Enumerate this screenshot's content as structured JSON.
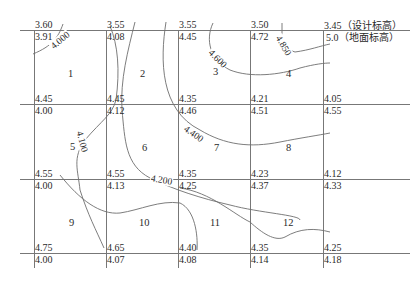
{
  "diagram": {
    "type": "grid-contour-map",
    "legend": {
      "design_elevation": "3.45（设计标高）",
      "ground_elevation": "5.0（地面标高）"
    },
    "grid_nodes": [
      {
        "row": 0,
        "col": 0,
        "design": "3.60",
        "ground": "3.91"
      },
      {
        "row": 0,
        "col": 1,
        "design": "3.55",
        "ground": "4.08"
      },
      {
        "row": 0,
        "col": 2,
        "design": "3.55",
        "ground": "4.45"
      },
      {
        "row": 0,
        "col": 3,
        "design": "3.50",
        "ground": "4.72"
      },
      {
        "row": 0,
        "col": 4,
        "design": "3.45",
        "ground": "5.0"
      },
      {
        "row": 1,
        "col": 0,
        "design": "4.45",
        "ground": "4.00"
      },
      {
        "row": 1,
        "col": 1,
        "design": "4.45",
        "ground": "4.12"
      },
      {
        "row": 1,
        "col": 2,
        "design": "4.35",
        "ground": "4.46"
      },
      {
        "row": 1,
        "col": 3,
        "design": "4.21",
        "ground": "4.51"
      },
      {
        "row": 1,
        "col": 4,
        "design": "4.05",
        "ground": "4.55"
      },
      {
        "row": 2,
        "col": 0,
        "design": "4.55",
        "ground": "4.00"
      },
      {
        "row": 2,
        "col": 1,
        "design": "4.55",
        "ground": "4.13"
      },
      {
        "row": 2,
        "col": 2,
        "design": "4.35",
        "ground": "4.25"
      },
      {
        "row": 2,
        "col": 3,
        "design": "4.23",
        "ground": "4.37"
      },
      {
        "row": 2,
        "col": 4,
        "design": "4.12",
        "ground": "4.33"
      },
      {
        "row": 3,
        "col": 0,
        "design": "4.75",
        "ground": "4.00"
      },
      {
        "row": 3,
        "col": 1,
        "design": "4.65",
        "ground": "4.07"
      },
      {
        "row": 3,
        "col": 2,
        "design": "4.40",
        "ground": "4.08"
      },
      {
        "row": 3,
        "col": 3,
        "design": "4.35",
        "ground": "4.14"
      },
      {
        "row": 3,
        "col": 4,
        "design": "4.25",
        "ground": "4.18"
      }
    ],
    "cells": [
      "1",
      "2",
      "3",
      "4",
      "5",
      "6",
      "7",
      "8",
      "9",
      "10",
      "11",
      "12"
    ],
    "contour_labels": [
      "4.000",
      "4.100",
      "4.200",
      "4.400",
      "4.600",
      "4.850"
    ],
    "colors": {
      "line": "#6e6e6e",
      "text": "#2a2a2a",
      "background": "#ffffff"
    }
  }
}
